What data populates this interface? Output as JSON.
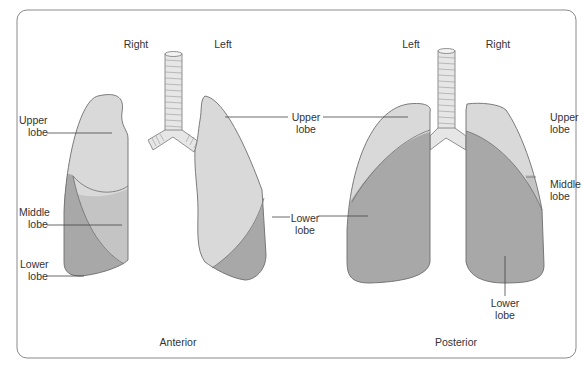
{
  "diagram": {
    "colors": {
      "border": "#8a8a8a",
      "upper_lobe": "#d9d9d9",
      "middle_lobe": "#c4c4c4",
      "lower_lobe": "#a8a8a8",
      "outline": "#6e6e6e",
      "trachea": "#e6e6e6",
      "leader_line": "#444444",
      "text": "#333333"
    },
    "anterior": {
      "caption": "Anterior",
      "side_right": "Right",
      "side_left": "Left",
      "labels": {
        "right_upper": [
          "Upper",
          "lobe"
        ],
        "right_middle": [
          "Middle",
          "lobe"
        ],
        "right_lower": [
          "Lower",
          "lobe"
        ],
        "left_upper": [
          "Upper",
          "lobe"
        ],
        "left_lower": [
          "Lower",
          "lobe"
        ]
      }
    },
    "posterior": {
      "caption": "Posterior",
      "side_left": "Left",
      "side_right": "Right",
      "labels": {
        "left_upper": [
          "Upper",
          "lobe"
        ],
        "left_lower": [
          "Lower",
          "lobe"
        ],
        "right_upper": [
          "Upper",
          "lobe"
        ],
        "right_middle": [
          "Middle",
          "lobe"
        ],
        "right_lower": [
          "Lower",
          "lobe"
        ]
      }
    }
  }
}
